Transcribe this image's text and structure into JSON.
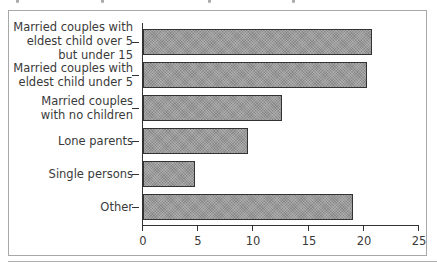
{
  "chart_data": {
    "type": "bar",
    "orientation": "horizontal",
    "title": "",
    "categories": [
      "Married couples with\neldest child over 5\nbut under 15",
      "Married couples with\neldest child under 5",
      "Married couples\nwith no children",
      "Lone parents",
      "Single persons",
      "Other"
    ],
    "values": [
      20.7,
      20.3,
      12.6,
      9.5,
      4.7,
      19.0
    ],
    "xlabel": "",
    "ylabel": "",
    "xlim": [
      0,
      25
    ],
    "xticks": [
      "0",
      "5",
      "10",
      "15",
      "20",
      "25"
    ],
    "grid": false,
    "legend": null,
    "bar_color": "#9a9a9a",
    "bar_edge_color": "#333333"
  }
}
